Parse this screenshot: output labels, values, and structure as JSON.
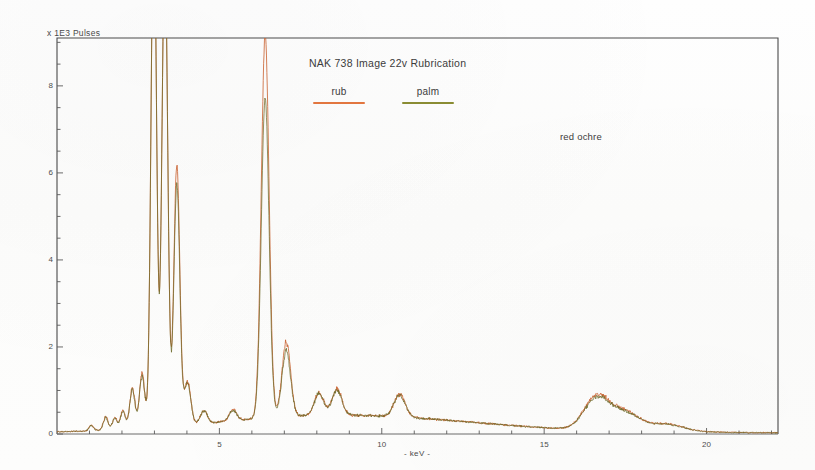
{
  "chart_data": {
    "type": "line",
    "title": "NAK 738 Image 22v  Rubrication",
    "xlabel": "- keV -",
    "ylabel": "x 1E3 Pulses",
    "xlim": [
      0,
      22.2
    ],
    "ylim": [
      0,
      9.1
    ],
    "xticks": [
      5,
      10,
      15,
      20
    ],
    "yticks": [
      0,
      2,
      4,
      6,
      8
    ],
    "xtick_labels": [
      "5",
      "10",
      "15",
      "20"
    ],
    "ytick_labels": [
      "0",
      "2",
      "4",
      "6",
      "8"
    ],
    "grid": false,
    "legend_position": "top-center",
    "annotations": [
      {
        "text": "red ochre",
        "x": 18.2,
        "y": 7.55
      }
    ],
    "series": [
      {
        "name": "rub",
        "color": "#c8602e",
        "legend_color": "#e2763f",
        "note": "peaks near 3.0 and 3.3 keV are clipped off-scale above the plot top",
        "peaks": [
          {
            "keV": 1.05,
            "height": 0.12
          },
          {
            "keV": 1.5,
            "height": 0.3
          },
          {
            "keV": 1.78,
            "height": 0.26
          },
          {
            "keV": 2.03,
            "height": 0.42
          },
          {
            "keV": 2.32,
            "height": 0.95
          },
          {
            "keV": 2.62,
            "height": 1.25
          },
          {
            "keV": 2.98,
            "height": 12.0
          },
          {
            "keV": 3.32,
            "height": 11.0
          },
          {
            "keV": 3.69,
            "height": 6.02
          },
          {
            "keV": 4.02,
            "height": 1.0
          },
          {
            "keV": 4.52,
            "height": 0.3
          },
          {
            "keV": 5.42,
            "height": 0.26
          },
          {
            "keV": 6.41,
            "height": 8.8
          },
          {
            "keV": 7.06,
            "height": 1.72
          },
          {
            "keV": 8.07,
            "height": 0.52
          },
          {
            "keV": 8.62,
            "height": 0.6
          },
          {
            "keV": 10.55,
            "height": 0.52
          },
          {
            "keV": 16.62,
            "height": 0.76
          },
          {
            "keV": 17.5,
            "height": 0.42
          },
          {
            "keV": 18.75,
            "height": 0.17
          }
        ]
      },
      {
        "name": "palm",
        "color": "#6d6a2a",
        "legend_color": "#8a8c33",
        "note": "tracks rub closely; lower at the 6.4 keV Fe line",
        "peaks": [
          {
            "keV": 1.05,
            "height": 0.11
          },
          {
            "keV": 1.5,
            "height": 0.28
          },
          {
            "keV": 1.78,
            "height": 0.25
          },
          {
            "keV": 2.03,
            "height": 0.4
          },
          {
            "keV": 2.32,
            "height": 0.9
          },
          {
            "keV": 2.62,
            "height": 1.18
          },
          {
            "keV": 2.98,
            "height": 12.0
          },
          {
            "keV": 3.32,
            "height": 11.0
          },
          {
            "keV": 3.69,
            "height": 5.55
          },
          {
            "keV": 4.02,
            "height": 0.95
          },
          {
            "keV": 4.52,
            "height": 0.29
          },
          {
            "keV": 5.42,
            "height": 0.25
          },
          {
            "keV": 6.41,
            "height": 7.35
          },
          {
            "keV": 7.06,
            "height": 1.52
          },
          {
            "keV": 8.07,
            "height": 0.5
          },
          {
            "keV": 8.62,
            "height": 0.57
          },
          {
            "keV": 10.55,
            "height": 0.5
          },
          {
            "keV": 16.62,
            "height": 0.72
          },
          {
            "keV": 17.5,
            "height": 0.4
          },
          {
            "keV": 18.75,
            "height": 0.16
          }
        ]
      }
    ]
  },
  "legend": {
    "rub": {
      "label": "rub",
      "color": "#e2763f"
    },
    "palm": {
      "label": "palm",
      "color": "#8a8c33"
    }
  }
}
